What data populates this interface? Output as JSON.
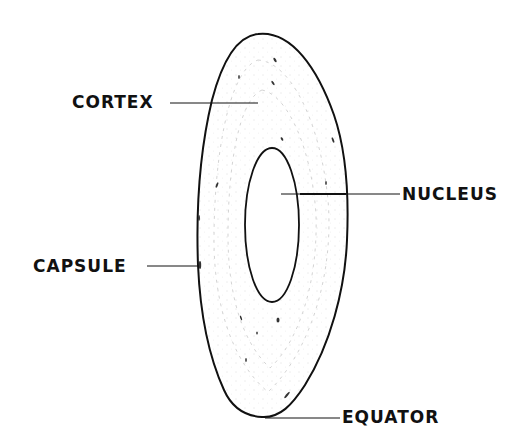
{
  "diagram": {
    "colors": {
      "background": "#ffffff",
      "outline": "#111111",
      "texture": "#9a9a9a"
    },
    "labels": {
      "cortex": "CORTEX",
      "nucleus": "NUCLEUS",
      "capsule": "CAPSULE",
      "equator": "EQUATOR"
    }
  }
}
